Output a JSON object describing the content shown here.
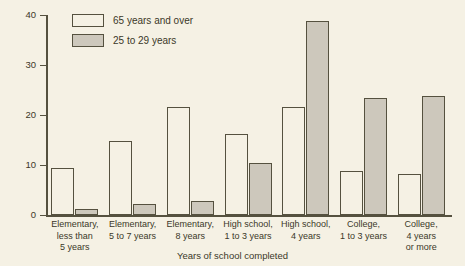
{
  "chart_data": {
    "type": "bar",
    "title": "",
    "xlabel": "Years of school completed",
    "ylabel": "Percent",
    "ylim": [
      0,
      40
    ],
    "yticks": [
      0,
      10,
      20,
      30,
      40
    ],
    "ytick_labels": [
      "0",
      "10",
      "20",
      "30",
      "40"
    ],
    "grid": false,
    "legend_position": "top-left",
    "categories": [
      "Elementary, less than 5 years",
      "Elementary, 5 to 7 years",
      "Elementary, 8 years",
      "High school, 1 to 3 years",
      "High school, 4 years",
      "College, 1 to 3 years",
      "College, 4 years or more"
    ],
    "category_lines": [
      [
        "Elementary,",
        "less than",
        "5 years"
      ],
      [
        "Elementary,",
        "5 to 7 years"
      ],
      [
        "Elementary,",
        "8 years"
      ],
      [
        "High school,",
        "1 to 3 years"
      ],
      [
        "High school,",
        "4 years"
      ],
      [
        "College,",
        "1 to 3 years"
      ],
      [
        "College,",
        "4 years",
        "or more"
      ]
    ],
    "series": [
      {
        "name": "65 years and over",
        "color": "#f5f1e4",
        "values": [
          9.4,
          14.8,
          21.7,
          16.2,
          21.7,
          8.9,
          8.2
        ]
      },
      {
        "name": "25 to 29 years",
        "color": "#cdc8bc",
        "values": [
          1.3,
          2.2,
          2.8,
          10.4,
          38.8,
          23.5,
          23.8
        ]
      }
    ]
  },
  "legend": {
    "items": [
      {
        "label": "65 years and over"
      },
      {
        "label": "25 to 29 years"
      }
    ]
  },
  "colors": {
    "background": "#f5f1e4",
    "outline": "#55513f",
    "series_a_fill": "#f5f1e4",
    "series_b_fill": "#cdc8bc",
    "text": "#3b3828"
  }
}
